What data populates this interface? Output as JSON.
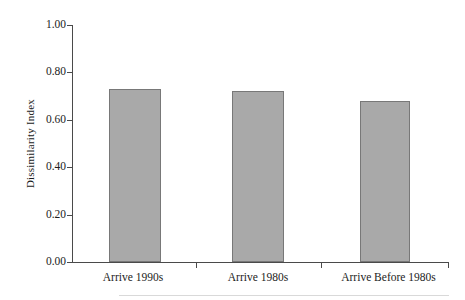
{
  "chart_data": {
    "type": "bar",
    "title": "",
    "subtitle": "",
    "xlabel": "",
    "ylabel": "Dissimilarity Index",
    "categories": [
      "Arrive 1990s",
      "Arrive 1980s",
      "Arrive Before 1980s"
    ],
    "values": [
      0.73,
      0.72,
      0.68
    ],
    "ylim": [
      0.0,
      1.0
    ],
    "ytick_labels": [
      "1.00",
      "0.80",
      "0.60",
      "0.40",
      "0.20",
      "0.00"
    ],
    "ytick_values": [
      1.0,
      0.8,
      0.6,
      0.4,
      0.2,
      0.0
    ],
    "grid": false,
    "legend": false,
    "legend_position": "none",
    "series": [
      {
        "name": "Dissimilarity Index",
        "values": [
          0.73,
          0.72,
          0.68
        ]
      }
    ],
    "colors": {
      "bar_fill": "#a9a9a9",
      "bar_stroke": "#787878",
      "axis": "#4a4a4a",
      "text": "#1c1c1c",
      "background": "#ffffff"
    }
  }
}
